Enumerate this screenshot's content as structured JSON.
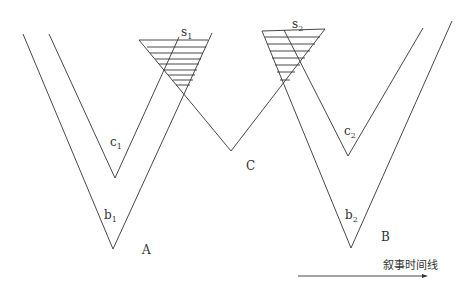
{
  "diagram": {
    "labels": {
      "s1": "s",
      "s1_sub": "1",
      "s2": "s",
      "s2_sub": "2",
      "c1": "c",
      "c1_sub": "1",
      "c2": "c",
      "c2_sub": "2",
      "b1": "b",
      "b1_sub": "1",
      "b2": "b",
      "b2_sub": "2",
      "A": "A",
      "B": "B",
      "C": "C"
    },
    "arrow_label": "叙事时间线",
    "stroke_color": "#333333"
  }
}
